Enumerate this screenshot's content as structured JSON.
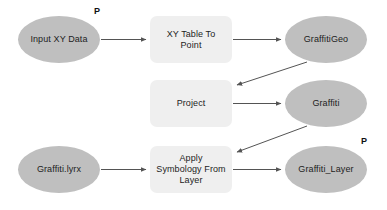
{
  "diagram": {
    "colors": {
      "data_node_fill": "#bfbfbf",
      "tool_node_fill": "#efefef",
      "edge_stroke": "#545454",
      "text": "#1d1d1d",
      "background": "#ffffff"
    },
    "parameter_marker_label": "P",
    "nodes": [
      {
        "id": "input-xy-data",
        "label": "Input XY Data",
        "kind": "data",
        "x": 18,
        "y": 16,
        "w": 82,
        "h": 47,
        "parameter": true
      },
      {
        "id": "xy-table-to-point",
        "label": "XY Table To\nPoint",
        "kind": "tool",
        "x": 150,
        "y": 16,
        "w": 82,
        "h": 47,
        "parameter": false
      },
      {
        "id": "graffitigeo",
        "label": "GraffitiGeo",
        "kind": "data",
        "x": 285,
        "y": 16,
        "w": 82,
        "h": 47,
        "parameter": false
      },
      {
        "id": "project",
        "label": "Project",
        "kind": "tool",
        "x": 150,
        "y": 80,
        "w": 82,
        "h": 47,
        "parameter": false
      },
      {
        "id": "graffiti",
        "label": "Graffiti",
        "kind": "data",
        "x": 285,
        "y": 80,
        "w": 82,
        "h": 47,
        "parameter": false
      },
      {
        "id": "graffiti-lyrx",
        "label": "Graffiti.lyrx",
        "kind": "data",
        "x": 18,
        "y": 146,
        "w": 82,
        "h": 47,
        "parameter": false
      },
      {
        "id": "apply-symbology-from-layer",
        "label": "Apply\nSymbology From\nLayer",
        "kind": "tool",
        "x": 150,
        "y": 146,
        "w": 82,
        "h": 47,
        "parameter": false
      },
      {
        "id": "graffiti-layer",
        "label": "Graffiti_Layer",
        "kind": "data",
        "x": 285,
        "y": 146,
        "w": 82,
        "h": 47,
        "parameter": true
      }
    ],
    "edges": [
      {
        "id": "e1",
        "from": "input-xy-data",
        "to": "xy-table-to-point",
        "x1": 101,
        "y1": 39.5,
        "x2": 146,
        "y2": 39.5
      },
      {
        "id": "e2",
        "from": "xy-table-to-point",
        "to": "graffitigeo",
        "x1": 233,
        "y1": 39.5,
        "x2": 281,
        "y2": 39.5
      },
      {
        "id": "e3",
        "from": "graffitigeo",
        "to": "project",
        "x1": 307,
        "y1": 62,
        "x2": 237,
        "y2": 85
      },
      {
        "id": "e4",
        "from": "project",
        "to": "graffiti",
        "x1": 233,
        "y1": 103.5,
        "x2": 281,
        "y2": 103.5
      },
      {
        "id": "e5",
        "from": "graffiti",
        "to": "apply-symbology-from-layer",
        "x1": 307,
        "y1": 126,
        "x2": 237,
        "y2": 152
      },
      {
        "id": "e6",
        "from": "graffiti-lyrx",
        "to": "apply-symbology-from-layer",
        "x1": 101,
        "y1": 169.5,
        "x2": 146,
        "y2": 169.5
      },
      {
        "id": "e7",
        "from": "apply-symbology-from-layer",
        "to": "graffiti-layer",
        "x1": 233,
        "y1": 169.5,
        "x2": 281,
        "y2": 169.5
      }
    ]
  }
}
